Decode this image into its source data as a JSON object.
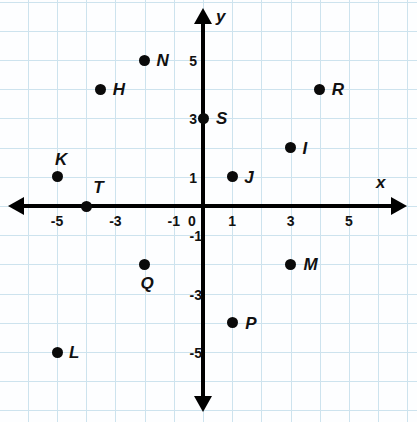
{
  "chart_data": {
    "type": "scatter",
    "title": "",
    "xlabel": "x",
    "ylabel": "y",
    "grid": true,
    "legend": "none",
    "xlim": [
      -6,
      6
    ],
    "ylim": [
      -6,
      6
    ],
    "x_ticks": [
      "-5",
      "-3",
      "-1",
      "0",
      "1",
      "3",
      "5"
    ],
    "x_tick_values": [
      -5,
      -3,
      -1,
      0,
      1,
      3,
      5
    ],
    "y_ticks": [
      "5",
      "3",
      "1",
      "-1",
      "-3",
      "-5"
    ],
    "y_tick_values": [
      5,
      3,
      1,
      -1,
      -3,
      -5
    ],
    "origin_label": "0",
    "points": [
      {
        "label": "N",
        "x": -2,
        "y": 5,
        "label_dx": 12,
        "label_dy": -8
      },
      {
        "label": "H",
        "x": -3.5,
        "y": 4,
        "label_dx": 12,
        "label_dy": -8
      },
      {
        "label": "R",
        "x": 4,
        "y": 4,
        "label_dx": 12,
        "label_dy": -8
      },
      {
        "label": "S",
        "x": 0,
        "y": 3,
        "label_dx": 13,
        "label_dy": -8
      },
      {
        "label": "I",
        "x": 3,
        "y": 2,
        "label_dx": 12,
        "label_dy": -8
      },
      {
        "label": "K",
        "x": -5,
        "y": 1,
        "label_dx": -2,
        "label_dy": -26
      },
      {
        "label": "J",
        "x": 1,
        "y": 1,
        "label_dx": 12,
        "label_dy": -8
      },
      {
        "label": "T",
        "x": -4,
        "y": 0,
        "label_dx": 7,
        "label_dy": -27
      },
      {
        "label": "Q",
        "x": -2,
        "y": -2,
        "label_dx": -4,
        "label_dy": 11
      },
      {
        "label": "M",
        "x": 3,
        "y": -2,
        "label_dx": 13,
        "label_dy": -8
      },
      {
        "label": "P",
        "x": 1,
        "y": -4,
        "label_dx": 13,
        "label_dy": -8
      },
      {
        "label": "L",
        "x": -5,
        "y": -5,
        "label_dx": 12,
        "label_dy": -8
      }
    ]
  },
  "colors": {
    "grid": "#cde3ee",
    "axis": "#000000",
    "point": "#0a0a0a",
    "text": "#111111",
    "background": "#fdfeff"
  },
  "geometry": {
    "origin_x": 203,
    "origin_y": 206,
    "unit": 29.2,
    "width": 417,
    "height": 422
  }
}
